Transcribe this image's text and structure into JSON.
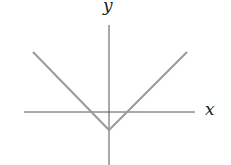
{
  "chart_data": {
    "type": "line",
    "title": "",
    "xlabel": "x",
    "ylabel": "y",
    "grid": false,
    "legend": null,
    "series": [
      {
        "name": "y = |x| - c",
        "color": "#9a9a9a",
        "points": [
          {
            "x": -4,
            "y": 4
          },
          {
            "x": -1,
            "y": 1
          },
          {
            "x": 0,
            "y": 0
          },
          {
            "x": 1,
            "y": 1
          },
          {
            "x": 4,
            "y": 4
          }
        ]
      }
    ],
    "vertex": {
      "x": 0,
      "y": -1
    },
    "x_intercepts": [
      -1,
      1
    ],
    "axis_color": "#555555",
    "line_color": "#9a9a9a"
  },
  "labels": {
    "x_axis": "x",
    "y_axis": "y"
  },
  "geometry": {
    "origin": [
      109,
      112
    ],
    "x_axis": {
      "x1": 24,
      "x2": 195,
      "y": 112
    },
    "y_axis": {
      "x": 109,
      "y1": 25,
      "y2": 165
    },
    "left_arm": {
      "x1": 33,
      "y1": 52,
      "x2": 109,
      "y2": 130
    },
    "right_arm": {
      "x1": 109,
      "y1": 130,
      "x2": 187,
      "y2": 52
    }
  }
}
